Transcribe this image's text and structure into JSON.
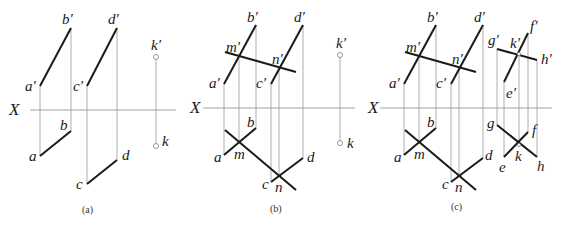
{
  "figure": {
    "type": "orthographic-projection-diagram",
    "colors": {
      "thick_line": "#1a1a1a",
      "thin_line": "#9a9a9a",
      "background": "#ffffff"
    },
    "axis_label": "X",
    "panels": [
      {
        "id": "a",
        "caption": "(a)",
        "labels": {
          "a_p": "a′",
          "b_p": "b′",
          "c_p": "c′",
          "d_p": "d′",
          "k_p": "k′",
          "a": "a",
          "b": "b",
          "c": "c",
          "d": "d",
          "k": "k"
        }
      },
      {
        "id": "b",
        "caption": "(b)",
        "labels": {
          "a_p": "a′",
          "b_p": "b′",
          "c_p": "c′",
          "d_p": "d′",
          "m_p": "m′",
          "n_p": "n′",
          "k_p": "k′",
          "a": "a",
          "b": "b",
          "c": "c",
          "d": "d",
          "m": "m",
          "n": "n",
          "k": "k"
        }
      },
      {
        "id": "c",
        "caption": "(c)",
        "labels": {
          "a_p": "a′",
          "b_p": "b′",
          "c_p": "c′",
          "d_p": "d′",
          "m_p": "m′",
          "n_p": "n′",
          "e_p": "e′",
          "f_p": "f′",
          "g_p": "g′",
          "h_p": "h′",
          "k_p": "k′",
          "a": "a",
          "b": "b",
          "c": "c",
          "d": "d",
          "m": "m",
          "n": "n",
          "e": "e",
          "f": "f",
          "g": "g",
          "h": "h",
          "k": "k"
        }
      }
    ]
  }
}
